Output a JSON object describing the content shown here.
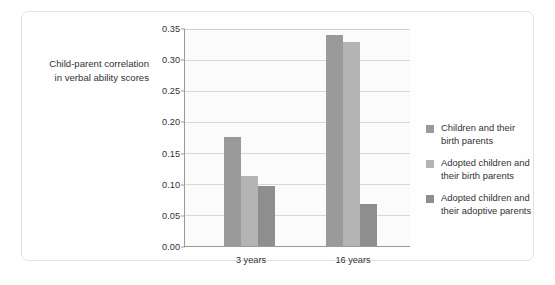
{
  "chart_data": {
    "type": "bar",
    "title": "",
    "subtitle": "",
    "xlabel": "",
    "ylabel": "Child-parent correlation\nin verbal ability scores",
    "categories": [
      "3 years",
      "16 years"
    ],
    "ylim": [
      0.0,
      0.35
    ],
    "yticks": [
      "0.00",
      "0.05",
      "0.10",
      "0.15",
      "0.20",
      "0.25",
      "0.30",
      "0.35"
    ],
    "ytick_values": [
      0.0,
      0.05,
      0.1,
      0.15,
      0.2,
      0.25,
      0.3,
      0.35
    ],
    "grid": true,
    "legend_position": "right",
    "series": [
      {
        "name": "Children and their\nbirth parents",
        "color": "#9a9a9a",
        "values": [
          0.175,
          0.338
        ]
      },
      {
        "name": "Adopted children and\ntheir birth parents",
        "color": "#b4b4b4",
        "values": [
          0.112,
          0.328
        ]
      },
      {
        "name": "Adopted children and\ntheir adoptive parents",
        "color": "#8e8e8e",
        "values": [
          0.097,
          0.068
        ]
      }
    ]
  },
  "colors": {
    "frame_border": "#e2e2e2",
    "plot_background": "#fbfbfb",
    "gridline": "#d8d8d8",
    "axis_line": "#9a9a9a",
    "text": "#333333"
  }
}
